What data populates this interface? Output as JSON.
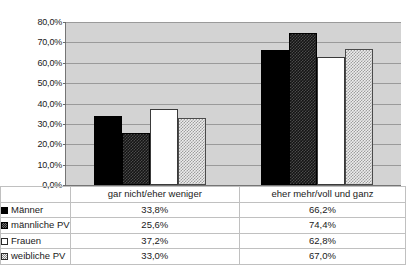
{
  "chart_data": {
    "type": "bar",
    "title": "",
    "xlabel": "",
    "ylabel": "",
    "ylim": [
      0,
      80
    ],
    "ytick_labels": [
      "80,0%",
      "70,0%",
      "60,0%",
      "50,0%",
      "40,0%",
      "30,0%",
      "20,0%",
      "10,0%",
      "0,0%"
    ],
    "ytick_values": [
      80,
      70,
      60,
      50,
      40,
      30,
      20,
      10,
      0
    ],
    "grid": true,
    "legend_position": "table-below",
    "categories": [
      "gar nicht/eher weniger",
      "eher mehr/voll und ganz"
    ],
    "series": [
      {
        "name": "Männer",
        "values": [
          33.8,
          66.2
        ],
        "labels": [
          "33,8%",
          "66,2%"
        ],
        "fill": "solid",
        "swatch": "sw-solid"
      },
      {
        "name": "männliche PV",
        "values": [
          25.6,
          74.4
        ],
        "labels": [
          "25,6%",
          "74,4%"
        ],
        "fill": "checker",
        "swatch": "sw-checker"
      },
      {
        "name": "Frauen",
        "values": [
          37.2,
          62.8
        ],
        "labels": [
          "37,2%",
          "62,8%"
        ],
        "fill": "white",
        "swatch": "sw-white"
      },
      {
        "name": "weibliche PV",
        "values": [
          33.0,
          67.0
        ],
        "labels": [
          "33,0%",
          "67,0%"
        ],
        "fill": "dotted",
        "swatch": "sw-dotted"
      }
    ],
    "colors": {
      "plot_background": "#d3d3d3",
      "gridline": "#9a9a9a",
      "axis": "#757575",
      "series_solid": "#000000",
      "series_checker": "#141414",
      "series_white": "#ffffff",
      "series_dotted": "#ededed"
    }
  }
}
